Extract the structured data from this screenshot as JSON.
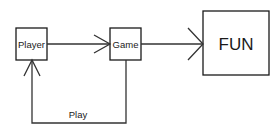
{
  "diagram": {
    "nodes": [
      {
        "id": "player",
        "label": "Player"
      },
      {
        "id": "game",
        "label": "Game"
      },
      {
        "id": "fun",
        "label": "FUN"
      }
    ],
    "edges": [
      {
        "from": "player",
        "to": "game",
        "label": ""
      },
      {
        "from": "game",
        "to": "fun",
        "label": ""
      },
      {
        "from": "game",
        "to": "player",
        "label": "Play"
      }
    ]
  },
  "colors": {
    "stroke": "#1a1a1a",
    "background": "#ffffff"
  }
}
